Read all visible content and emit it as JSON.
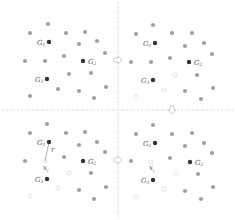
{
  "diagram": {
    "title": "",
    "dividers": {
      "vertical_x": 118,
      "horizontal_y": 110,
      "color": "#bbbbbb"
    },
    "arrows": [
      {
        "name": "arrow-right-top",
        "x": 118,
        "y": 60,
        "direction": "right"
      },
      {
        "name": "arrow-down-right",
        "x": 172,
        "y": 110,
        "direction": "down"
      },
      {
        "name": "arrow-right-bottom",
        "x": 118,
        "y": 160,
        "direction": "right"
      }
    ],
    "colors": {
      "point": "#a0a0a0",
      "centroid": "#333333",
      "hollow": "#d8d8d8",
      "line": "#777777"
    },
    "panels": [
      {
        "name": "panel-top-left",
        "ox": 0,
        "oy": 0,
        "centroids": [
          {
            "label": "G",
            "sub": "1",
            "x": 49,
            "y": 42
          },
          {
            "label": "G",
            "sub": "2",
            "x": 83,
            "y": 61
          },
          {
            "label": "G",
            "sub": "3",
            "x": 47,
            "y": 79
          }
        ],
        "points": [
          [
            48,
            24
          ],
          [
            30,
            33
          ],
          [
            66,
            33
          ],
          [
            85,
            32
          ],
          [
            79,
            44
          ],
          [
            97,
            41
          ],
          [
            105,
            53
          ],
          [
            25,
            61
          ],
          [
            45,
            61
          ],
          [
            64,
            56
          ],
          [
            69,
            74
          ],
          [
            91,
            73
          ],
          [
            58,
            89
          ],
          [
            79,
            91
          ],
          [
            106,
            87
          ],
          [
            30,
            96
          ],
          [
            94,
            98
          ]
        ],
        "hollow": [],
        "annotations": []
      },
      {
        "name": "panel-top-right",
        "ox": 117,
        "oy": 0,
        "centroids": [
          {
            "label": "G",
            "sub": "1",
            "x": 38,
            "y": 43
          },
          {
            "label": "G",
            "sub": "2",
            "x": 72,
            "y": 62
          },
          {
            "label": "G",
            "sub": "3",
            "x": 36,
            "y": 80
          }
        ],
        "points": [
          [
            36,
            25
          ],
          [
            19,
            34
          ],
          [
            55,
            33
          ],
          [
            75,
            33
          ],
          [
            68,
            46
          ],
          [
            87,
            43
          ],
          [
            95,
            54
          ],
          [
            14,
            62
          ],
          [
            34,
            62
          ],
          [
            53,
            58
          ],
          [
            80,
            75
          ],
          [
            68,
            91
          ],
          [
            96,
            88
          ],
          [
            84,
            99
          ]
        ],
        "hollow": [
          [
            58,
            75
          ],
          [
            47,
            90
          ],
          [
            19,
            97
          ]
        ],
        "annotations": []
      },
      {
        "name": "panel-bottom-left",
        "ox": 0,
        "oy": 110,
        "centroids": [
          {
            "label": "G",
            "sub": "1",
            "x": 49,
            "y": 32
          },
          {
            "label": "G",
            "sub": "2",
            "x": 83,
            "y": 51
          },
          {
            "label": "G",
            "sub": "3",
            "x": 47,
            "y": 69
          }
        ],
        "points": [
          [
            47,
            14
          ],
          [
            30,
            23
          ],
          [
            66,
            23
          ],
          [
            85,
            22
          ],
          [
            79,
            35
          ],
          [
            97,
            32
          ],
          [
            105,
            42
          ],
          [
            25,
            51
          ],
          [
            64,
            47
          ],
          [
            91,
            63
          ],
          [
            79,
            80
          ],
          [
            106,
            77
          ],
          [
            94,
            89
          ]
        ],
        "hollow": [
          [
            45,
            51
          ],
          [
            69,
            63
          ],
          [
            58,
            78
          ],
          [
            30,
            86
          ]
        ],
        "annotations": [
          {
            "type": "radius-line",
            "from": [
              49,
              32
            ],
            "to": [
              45,
              51
            ],
            "label": "r",
            "lx": 51,
            "ly": 42
          },
          {
            "type": "point-label",
            "label": "x",
            "sub": "i",
            "x": 45,
            "y": 58
          }
        ]
      },
      {
        "name": "panel-bottom-right",
        "ox": 117,
        "oy": 110,
        "centroids": [
          {
            "label": "G",
            "sub": "1",
            "x": 38,
            "y": 33
          },
          {
            "label": "G",
            "sub": "2",
            "x": 73,
            "y": 52
          },
          {
            "label": "G",
            "sub": "3",
            "x": 36,
            "y": 70
          }
        ],
        "points": [
          [
            36,
            15
          ],
          [
            19,
            24
          ],
          [
            55,
            24
          ],
          [
            75,
            23
          ],
          [
            68,
            36
          ],
          [
            87,
            33
          ],
          [
            95,
            43
          ],
          [
            14,
            51
          ],
          [
            53,
            48
          ],
          [
            81,
            64
          ],
          [
            68,
            81
          ],
          [
            96,
            77
          ],
          [
            84,
            89
          ]
        ],
        "hollow": [
          [
            34,
            52
          ],
          [
            59,
            64
          ],
          [
            47,
            79
          ],
          [
            19,
            87
          ]
        ],
        "annotations": [
          {
            "type": "point-label",
            "label": "x",
            "sub": "i",
            "x": 34,
            "y": 58
          }
        ]
      }
    ]
  }
}
